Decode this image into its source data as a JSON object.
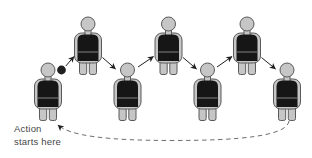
{
  "diagram": {
    "caption": {
      "line1": "Action",
      "line2": "starts here"
    },
    "colors": {
      "background": "#ffffff",
      "skin": "#c6c6c6",
      "outline": "#5a5a5a",
      "vest": "#161616",
      "belt": "#8f8f8f",
      "arrow": "#1f1f1f",
      "loop": "#6e6e6e",
      "text": "#474747"
    },
    "people": [
      {
        "id": "person-1",
        "cx": 48,
        "top": 63
      },
      {
        "id": "person-2",
        "cx": 88,
        "top": 17
      },
      {
        "id": "person-3",
        "cx": 127.5,
        "top": 63
      },
      {
        "id": "person-4",
        "cx": 168.5,
        "top": 17
      },
      {
        "id": "person-5",
        "cx": 207.5,
        "top": 63
      },
      {
        "id": "person-6",
        "cx": 247,
        "top": 17
      },
      {
        "id": "person-7",
        "cx": 287,
        "top": 63
      }
    ],
    "ball": {
      "cx": 61.5,
      "cy": 70,
      "r": 4.4
    },
    "arrows": [
      {
        "x1": 65.8,
        "y1": 66,
        "x2": 74,
        "y2": 56.5
      },
      {
        "x1": 102.5,
        "y1": 57.5,
        "x2": 115.5,
        "y2": 69
      },
      {
        "x1": 138,
        "y1": 67,
        "x2": 153.5,
        "y2": 56.5
      },
      {
        "x1": 183,
        "y1": 57.5,
        "x2": 196.5,
        "y2": 69
      },
      {
        "x1": 217,
        "y1": 67,
        "x2": 232,
        "y2": 56.5
      },
      {
        "x1": 261.5,
        "y1": 57.5,
        "x2": 275.5,
        "y2": 69
      }
    ],
    "loop": {
      "path": "M 289 121 C 287 136 240 140.5 173 140.5 C 108 140.5 70 136 58 125",
      "dash": "4.5 3.5"
    }
  }
}
